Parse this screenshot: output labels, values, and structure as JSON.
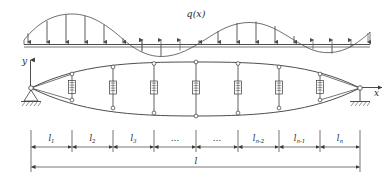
{
  "figure": {
    "load_label": "q(x)",
    "axis_y_label": "y",
    "axis_x_label": "x",
    "total_span_label": "l",
    "segment_labels": [
      {
        "main": "l",
        "sub": "1"
      },
      {
        "main": "l",
        "sub": "2"
      },
      {
        "main": "l",
        "sub": "3"
      },
      {
        "main": "…",
        "sub": ""
      },
      {
        "main": "…",
        "sub": ""
      },
      {
        "main": "l",
        "sub": "n-2"
      },
      {
        "main": "l",
        "sub": "n-1"
      },
      {
        "main": "l",
        "sub": "n"
      }
    ],
    "load_arrow_count": 19,
    "vertical_member_count": 7,
    "colors": {
      "line": "#3a3a3a",
      "curve": "#4a4a4a",
      "arrow": "#555555",
      "hatch": "#4a4a4a",
      "background": "#ffffff"
    }
  }
}
